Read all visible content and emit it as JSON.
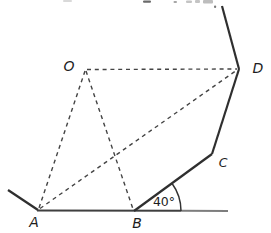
{
  "diagram": {
    "background": "#ffffff",
    "solid_color": "#2f2f2f",
    "dashed_color": "#444444",
    "label_color": "#1d1d1d",
    "points": {
      "O": {
        "x": 85,
        "y": 70,
        "label": "O",
        "label_x": 69,
        "label_y": 66
      },
      "A": {
        "x": 38,
        "y": 210,
        "label": "A",
        "label_x": 34,
        "label_y": 222
      },
      "B": {
        "x": 134,
        "y": 211,
        "label": "B",
        "label_x": 137,
        "label_y": 223
      },
      "C": {
        "x": 212,
        "y": 154,
        "label": "C",
        "label_x": 223,
        "label_y": 163
      },
      "D": {
        "x": 239,
        "y": 69,
        "label": "D",
        "label_x": 258,
        "label_y": 68
      }
    },
    "solid_segments": [
      {
        "name": "left-ray",
        "x1": 8,
        "y1": 190,
        "x2": 38,
        "y2": 210,
        "color": "#2f2f2f",
        "width": 2.2
      },
      {
        "name": "ground-line-left",
        "x1": 37,
        "y1": 210.5,
        "x2": 181,
        "y2": 210.8,
        "color": "#3f3f3f",
        "width": 2
      },
      {
        "name": "ground-line-right",
        "x1": 181,
        "y1": 210.8,
        "x2": 228,
        "y2": 211,
        "color": "#7d7d7d",
        "width": 2
      },
      {
        "name": "segment-BC",
        "x1": 134,
        "y1": 211,
        "x2": 212,
        "y2": 154,
        "color": "#2f2f2f",
        "width": 2.2
      },
      {
        "name": "segment-CD",
        "x1": 212,
        "y1": 154,
        "x2": 239,
        "y2": 69,
        "color": "#2f2f2f",
        "width": 2.2
      },
      {
        "name": "top-ray",
        "x1": 239,
        "y1": 69,
        "x2": 222,
        "y2": 6,
        "color": "#2f2f2f",
        "width": 2.2
      }
    ],
    "dashed_segments": [
      {
        "name": "dashed-OD",
        "x1": 87,
        "y1": 69.5,
        "x2": 237,
        "y2": 69,
        "color": "#444444",
        "width": 1.4
      },
      {
        "name": "dashed-OA",
        "x1": 85,
        "y1": 71,
        "x2": 39,
        "y2": 208,
        "color": "#444444",
        "width": 1.4
      },
      {
        "name": "dashed-OB",
        "x1": 86,
        "y1": 71,
        "x2": 133,
        "y2": 209,
        "color": "#444444",
        "width": 1.4
      },
      {
        "name": "dashed-AD",
        "x1": 40,
        "y1": 208.5,
        "x2": 237,
        "y2": 70,
        "color": "#444444",
        "width": 1.4
      }
    ],
    "angle": {
      "label": "40°",
      "label_x": 164,
      "label_y": 202,
      "vertex_x": 134,
      "vertex_y": 211,
      "radius": 47,
      "start_deg": 0,
      "end_deg": 36.2,
      "arc_color": "#333333",
      "arc_width": 1.5
    },
    "cropped_text_remnants": [
      {
        "x": 63,
        "y": 0,
        "w": 9,
        "h": 2,
        "color": "#d9d9d9"
      },
      {
        "x": 143,
        "y": 0.5,
        "w": 8,
        "h": 2.2,
        "color": "#6a6a6a"
      },
      {
        "x": 173.5,
        "y": 1,
        "w": 3.5,
        "h": 2,
        "color": "#a6a6a6"
      },
      {
        "x": 186,
        "y": 0.5,
        "w": 6,
        "h": 2.5,
        "color": "#c4c4c4"
      },
      {
        "x": 195,
        "y": 0,
        "w": 5,
        "h": 3,
        "color": "#c4c4c4"
      },
      {
        "x": 203,
        "y": 0,
        "w": 10,
        "h": 3.5,
        "color": "#bdbdbd"
      },
      {
        "x": 214,
        "y": 5.5,
        "w": 2.2,
        "h": 2.5,
        "color": "#7a7a7a"
      }
    ]
  }
}
